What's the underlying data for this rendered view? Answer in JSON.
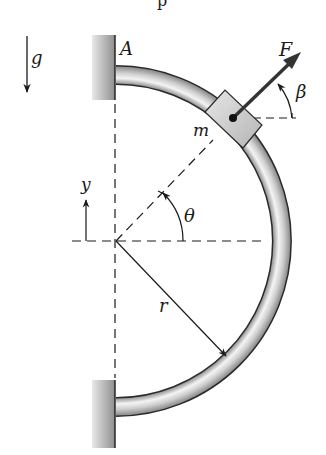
{
  "figure": {
    "top_fragment": "p",
    "labels": {
      "gravity": "g",
      "support_top": "A",
      "force": "F",
      "force_angle": "β",
      "mass": "m",
      "axis_y": "y",
      "position_angle": "θ",
      "radius": "r"
    }
  },
  "colors": {
    "ink": "#1a1a1a",
    "wall": "#9e9e9e",
    "tube_edge": "#2a2a2a",
    "tube_fill": "#d9d9d9",
    "collar_fill": "#cfcfcf",
    "force_arrow": "#333333"
  },
  "geometry": {
    "center": [
      116,
      241
    ],
    "tube_radius": 166,
    "tube_width": 19,
    "theta_deg": 46,
    "beta_deg": 44
  }
}
